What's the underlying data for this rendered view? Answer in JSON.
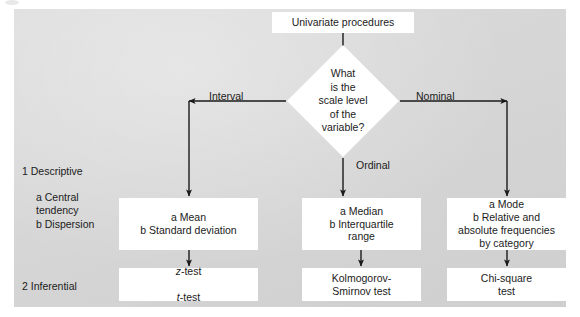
{
  "diagram": {
    "type": "flowchart",
    "title_node": "Univariate procedures",
    "decision": "What\nis the\nscale level\nof the\nvariable?",
    "edge_labels": {
      "left": "Interval",
      "middle": "Ordinal",
      "right": "Nominal"
    },
    "row_labels": {
      "descriptive": "1  Descriptive",
      "descriptive_sub": "a  Central\n    tendency\nb  Dispersion",
      "inferential": "2  Inferential"
    },
    "descriptive_boxes": {
      "interval": "a  Mean\nb  Standard deviation",
      "ordinal": "a  Median\nb  Interquartile\n    range",
      "nominal": "a  Mode\nb  Relative and\nabsolute frequencies\nby category"
    },
    "inferential_boxes": {
      "interval_line1": "z",
      "interval_line1_rest": "-test",
      "interval_line2": "t",
      "interval_line2_rest": "-test",
      "ordinal": "Kolmogorov-\nSmirnov test",
      "nominal": "Chi-square\ntest"
    },
    "colors": {
      "panel_background": "#d8d8d8",
      "node_fill": "#ffffff",
      "text": "#1b1b1b",
      "connector": "#1a1a1a"
    }
  }
}
